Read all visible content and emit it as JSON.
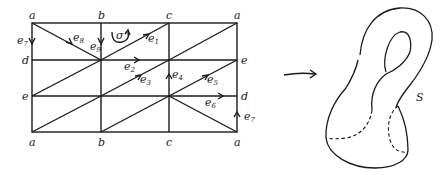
{
  "diagram": {
    "grid": {
      "columns_x": [
        32,
        101,
        169,
        237
      ],
      "rows_y": [
        23,
        60,
        96,
        132
      ]
    },
    "vertex_labels": {
      "top": [
        "a",
        "b",
        "c",
        "a"
      ],
      "bottom": [
        "a",
        "b",
        "c",
        "a"
      ],
      "left": [
        "a",
        "d",
        "e",
        "a"
      ],
      "right": [
        "a",
        "e",
        "d",
        "a"
      ]
    },
    "edge_labels": {
      "e1": "e",
      "e1_sub": "1",
      "e2": "e",
      "e2_sub": "2",
      "e3": "e",
      "e3_sub": "3",
      "e4": "e",
      "e4_sub": "4",
      "e5": "e",
      "e5_sub": "5",
      "e6": "e",
      "e6_sub": "6",
      "e7_left": "e",
      "e7_left_sub": "7",
      "e7_right": "e",
      "e7_right_sub": "7",
      "e8": "e",
      "e8_sub": "8",
      "e9": "e",
      "e9_sub": "9"
    },
    "simplex_label": "σ",
    "map_arrow": "→",
    "surface_label": "S"
  }
}
